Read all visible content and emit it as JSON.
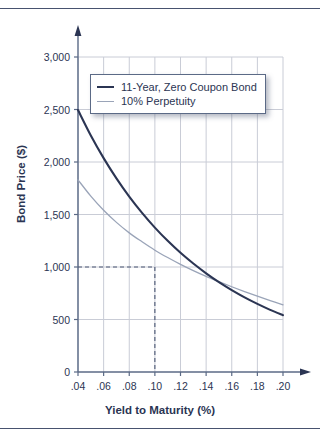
{
  "figure": {
    "name": "bond-price-vs-yield-chart",
    "has_top_rule": true,
    "has_bottom_rule": true
  },
  "colors": {
    "zero_coupon_line": "#2b3553",
    "perpetuity_line": "#9aa4b8",
    "axis": "#5b6a86",
    "grid": "#c9ccd6",
    "text": "#2b3553",
    "dashed_guide": "#4a5672",
    "background": "#ffffff"
  },
  "chart_data": {
    "type": "line",
    "title": "",
    "xlabel": "Yield to Maturity (%)",
    "ylabel": "Bond Price ($)",
    "xlim": [
      0.04,
      0.2
    ],
    "ylim": [
      0,
      3000
    ],
    "grid": true,
    "legend_position": "upper-left-inside",
    "xticks": [
      0.04,
      0.06,
      0.08,
      0.1,
      0.12,
      0.14,
      0.16,
      0.18,
      0.2
    ],
    "xtick_labels": [
      ".04",
      ".06",
      ".08",
      ".10",
      ".12",
      ".14",
      ".16",
      ".18",
      ".20"
    ],
    "yticks": [
      0,
      500,
      1000,
      1500,
      2000,
      2500,
      3000
    ],
    "ytick_labels": [
      "0",
      "500",
      "1,000",
      "1,500",
      "2,000",
      "2,500",
      "3,000"
    ],
    "x": [
      0.04,
      0.05,
      0.06,
      0.07,
      0.08,
      0.09,
      0.1,
      0.11,
      0.12,
      0.13,
      0.14,
      0.15,
      0.16,
      0.17,
      0.18,
      0.19,
      0.2
    ],
    "series": [
      {
        "name": "11-Year, Zero Coupon Bond",
        "color": "#2b3553",
        "width": 2.1,
        "values": [
          2495,
          2253,
          2037,
          1844,
          1670,
          1515,
          1375,
          1249,
          1135,
          1033,
          940,
          856,
          780,
          711,
          649,
          592,
          541
        ]
      },
      {
        "name": "10% Perpetuity",
        "color": "#9aa4b8",
        "width": 1.3,
        "values": [
          1830,
          1675,
          1540,
          1425,
          1325,
          1240,
          1160,
          1090,
          1025,
          965,
          910,
          860,
          812,
          766,
          722,
          680,
          640
        ]
      }
    ],
    "annotations": [
      {
        "type": "dashed-guide",
        "name": "par-value-guide",
        "x": 0.1,
        "y": 1000,
        "note": "dashed crosshair marking 1,000 at .10"
      }
    ]
  },
  "legend": {
    "entries": [
      {
        "label": "11-Year, Zero Coupon Bond"
      },
      {
        "label": "10% Perpetuity"
      }
    ]
  }
}
